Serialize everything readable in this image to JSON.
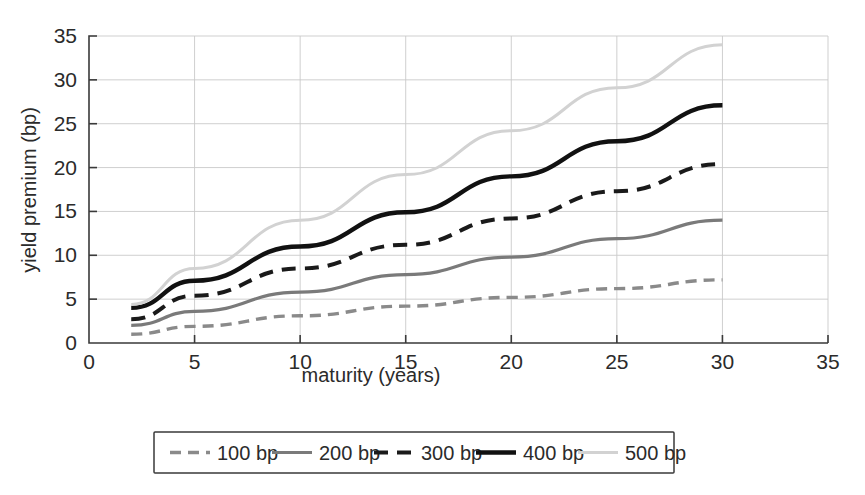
{
  "chart_data": {
    "type": "line",
    "title": "",
    "xlabel": "maturity (years)",
    "ylabel": "yield premium (bp)",
    "xlim": [
      0,
      35
    ],
    "ylim": [
      0,
      35
    ],
    "xticks": [
      0,
      5,
      10,
      15,
      20,
      25,
      30,
      35
    ],
    "xtick_labels": [
      "0",
      "5",
      "10",
      "15",
      "20",
      "25",
      "30",
      "35"
    ],
    "yticks": [
      0,
      5,
      10,
      15,
      20,
      25,
      30,
      35
    ],
    "ytick_labels": [
      "0",
      "5",
      "10",
      "15",
      "20",
      "25",
      "30",
      "35"
    ],
    "grid": true,
    "legend_position": "below-center",
    "x": [
      2,
      5,
      10,
      15,
      20,
      25,
      30
    ],
    "series": [
      {
        "name": "100 bp",
        "label": "100 bp",
        "color": "#8a8a8a",
        "style": "dashed",
        "width": 3.4,
        "dash": "11,7",
        "values": [
          1.0,
          1.9,
          3.1,
          4.2,
          5.2,
          6.2,
          7.2
        ]
      },
      {
        "name": "200 bp",
        "label": "200 bp",
        "color": "#7a7a7a",
        "style": "solid",
        "width": 3.2,
        "dash": "none",
        "values": [
          2.0,
          3.6,
          5.8,
          7.8,
          9.8,
          11.9,
          14.0
        ]
      },
      {
        "name": "300 bp",
        "label": "300 bp",
        "color": "#1a1a1a",
        "style": "dashed",
        "width": 4.0,
        "dash": "14,9",
        "values": [
          2.7,
          5.4,
          8.5,
          11.2,
          14.2,
          17.3,
          20.4
        ]
      },
      {
        "name": "400 bp",
        "label": "400 bp",
        "color": "#111111",
        "style": "solid",
        "width": 4.4,
        "dash": "none",
        "values": [
          4.0,
          7.1,
          11.0,
          14.9,
          19.0,
          23.0,
          27.1
        ]
      },
      {
        "name": "500 bp",
        "label": "500 bp",
        "color": "#d2d2d2",
        "style": "solid",
        "width": 3.0,
        "dash": "none",
        "values": [
          4.4,
          8.5,
          14.0,
          19.2,
          24.2,
          29.1,
          34.0
        ]
      }
    ]
  },
  "legend": {
    "items": [
      {
        "label": "100 bp"
      },
      {
        "label": "200 bp"
      },
      {
        "label": "300 bp"
      },
      {
        "label": "400 bp"
      },
      {
        "label": "500 bp"
      }
    ]
  }
}
